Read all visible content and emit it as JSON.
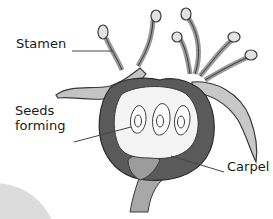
{
  "diagram": {
    "labels": {
      "stamen": "Stamen",
      "seeds_line1": "Seeds",
      "seeds_line2": "forming",
      "carpel": "Carpel"
    },
    "colors": {
      "text": "#1a1a1a",
      "ovary_wall": "#5a5a5a",
      "ovary_interior": "#f4f4f4",
      "petal_fill": "#bdbdbd",
      "stamen_fill": "#c8c8c8",
      "stalk_fill": "#a8a8a8",
      "outline": "#3a3a3a",
      "leader_line": "#444444",
      "corner_circle": "#d9d9d9"
    },
    "seed_count": 3,
    "stamen_count": 6
  }
}
